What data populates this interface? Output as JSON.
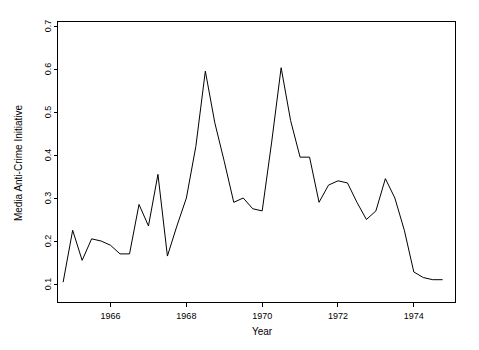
{
  "chart_data": {
    "type": "line",
    "title": "",
    "xlabel": "Year",
    "ylabel": "Media Anti-Crime Initiative",
    "xlim": [
      1964.6,
      1975.1
    ],
    "ylim": [
      0.1,
      0.7
    ],
    "grid": false,
    "legend": null,
    "xticks": [
      1966,
      1968,
      1970,
      1972,
      1974
    ],
    "xtick_labels": [
      "1966",
      "1968",
      "1970",
      "1972",
      "1974"
    ],
    "yticks": [
      0.1,
      0.2,
      0.3,
      0.4,
      0.5,
      0.6,
      0.7
    ],
    "ytick_labels": [
      "0.1",
      "0.2",
      "0.3",
      "0.4",
      "0.5",
      "0.6",
      "0.7"
    ],
    "line_color": "#000000",
    "x": [
      1964.75,
      1965.0,
      1965.25,
      1965.5,
      1965.75,
      1966.0,
      1966.25,
      1966.5,
      1966.75,
      1967.0,
      1967.25,
      1967.5,
      1967.75,
      1968.0,
      1968.25,
      1968.5,
      1968.75,
      1969.0,
      1969.25,
      1969.5,
      1969.75,
      1970.0,
      1970.25,
      1970.5,
      1970.75,
      1971.0,
      1971.25,
      1971.5,
      1971.75,
      1972.0,
      1972.25,
      1972.5,
      1972.75,
      1973.0,
      1973.25,
      1973.5,
      1973.75,
      1974.0,
      1974.25,
      1974.5,
      1974.75
    ],
    "values": [
      0.105,
      0.225,
      0.155,
      0.205,
      0.2,
      0.19,
      0.17,
      0.17,
      0.285,
      0.235,
      0.355,
      0.165,
      0.235,
      0.3,
      0.42,
      0.595,
      0.475,
      0.385,
      0.29,
      0.3,
      0.275,
      0.27,
      0.43,
      0.603,
      0.48,
      0.395,
      0.395,
      0.29,
      0.33,
      0.34,
      0.335,
      0.29,
      0.25,
      0.27,
      0.345,
      0.3,
      0.225,
      0.128,
      0.115,
      0.11,
      0.11
    ]
  },
  "axes": {
    "y_axis_title": "Media Anti-Crime Initiative",
    "x_axis_title": "Year"
  }
}
